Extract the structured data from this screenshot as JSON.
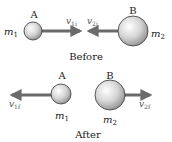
{
  "before": {
    "caption": "Before",
    "ball_a": {
      "label": "A",
      "mass": "m",
      "mass_sub": "1"
    },
    "ball_b": {
      "label": "B",
      "mass": "m",
      "mass_sub": "2"
    },
    "v1": {
      "sym": "v",
      "sub": "1i"
    },
    "v2": {
      "sym": "v",
      "sub": "2i"
    }
  },
  "after": {
    "caption": "After",
    "ball_a": {
      "label": "A",
      "mass": "m",
      "mass_sub": "1"
    },
    "ball_b": {
      "label": "B",
      "mass": "m",
      "mass_sub": "2"
    },
    "v1": {
      "sym": "v",
      "sub": "1f"
    },
    "v2": {
      "sym": "v",
      "sub": "2f"
    }
  },
  "colors": {
    "arrow": "#6b6b6b",
    "ball_edge": "#333333",
    "ball_light": "#ffffff",
    "ball_dark": "#9a9a9a"
  }
}
